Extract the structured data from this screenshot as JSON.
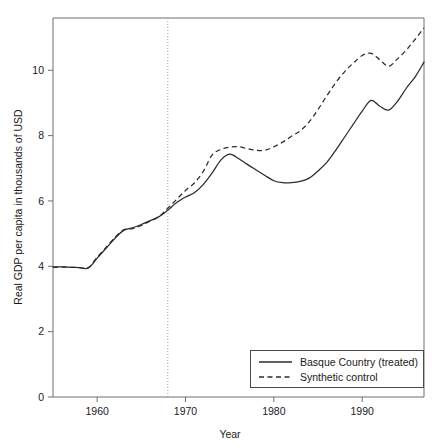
{
  "chart_data": {
    "type": "line",
    "title": "",
    "xlabel": "Year",
    "ylabel": "Real GDP per capita in thousands of USD",
    "xlim": [
      1955,
      1997
    ],
    "ylim": [
      0,
      11.6
    ],
    "xticks": [
      1960,
      1970,
      1980,
      1990
    ],
    "xtick_labels": [
      "1960",
      "1970",
      "1980",
      "1990"
    ],
    "yticks": [
      0,
      2,
      4,
      6,
      8,
      10
    ],
    "ytick_labels": [
      "0",
      "2",
      "4",
      "6",
      "8",
      "10"
    ],
    "grid": false,
    "legend_position": "lower right",
    "annotations": [
      {
        "name": "treatment-year-line",
        "type": "vertical-dotted-line",
        "x": 1968,
        "label": ""
      }
    ],
    "x": [
      1955,
      1956,
      1957,
      1958,
      1959,
      1960,
      1961,
      1962,
      1963,
      1964,
      1965,
      1966,
      1967,
      1968,
      1969,
      1970,
      1971,
      1972,
      1973,
      1974,
      1975,
      1976,
      1977,
      1978,
      1979,
      1980,
      1981,
      1982,
      1983,
      1984,
      1985,
      1986,
      1987,
      1988,
      1989,
      1990,
      1991,
      1992,
      1993,
      1994,
      1995,
      1996,
      1997
    ],
    "series": [
      {
        "name": "Basque Country (treated)",
        "style": "solid",
        "color": "#2b2b2b",
        "values": [
          3.98,
          3.98,
          3.97,
          3.96,
          3.95,
          4.25,
          4.55,
          4.85,
          5.1,
          5.18,
          5.28,
          5.4,
          5.52,
          5.72,
          5.95,
          6.12,
          6.25,
          6.5,
          6.85,
          7.25,
          7.43,
          7.3,
          7.12,
          6.95,
          6.78,
          6.62,
          6.56,
          6.56,
          6.6,
          6.7,
          6.92,
          7.18,
          7.55,
          7.95,
          8.35,
          8.75,
          9.08,
          8.9,
          8.78,
          9.05,
          9.45,
          9.8,
          10.25
        ]
      },
      {
        "name": "Synthetic control",
        "style": "dashed",
        "color": "#2b2b2b",
        "values": [
          3.97,
          3.98,
          3.97,
          3.96,
          3.96,
          4.28,
          4.58,
          4.88,
          5.12,
          5.15,
          5.25,
          5.38,
          5.52,
          5.78,
          6.05,
          6.32,
          6.55,
          6.9,
          7.4,
          7.58,
          7.65,
          7.66,
          7.6,
          7.55,
          7.55,
          7.66,
          7.8,
          7.98,
          8.15,
          8.42,
          8.8,
          9.22,
          9.62,
          9.95,
          10.22,
          10.45,
          10.52,
          10.32,
          10.12,
          10.35,
          10.62,
          10.95,
          11.3
        ]
      }
    ]
  },
  "legend": {
    "entries": [
      {
        "label": "Basque Country (treated)",
        "style": "solid"
      },
      {
        "label": "Synthetic control",
        "style": "dashed"
      }
    ]
  },
  "axes": {
    "x_title": "Year",
    "y_title": "Real GDP per capita in thousands of USD"
  }
}
